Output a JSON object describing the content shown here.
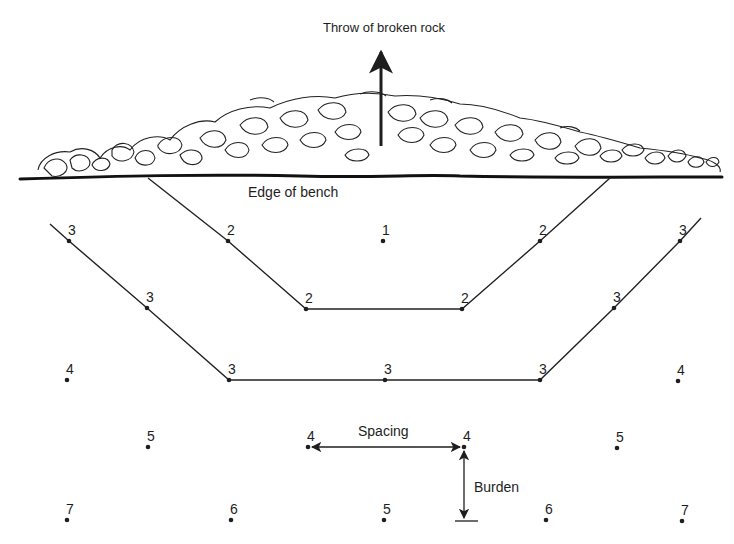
{
  "figure": {
    "title": "Throw of broken rock",
    "bench_label": "Edge of bench",
    "spacing_label": "Spacing",
    "burden_label": "Burden",
    "colors": {
      "ink": "#1e1e1e",
      "background": "#ffffff"
    }
  },
  "holes": [
    {
      "id": "r1c1",
      "delay": "3",
      "x": 69,
      "y": 241
    },
    {
      "id": "r1c2",
      "delay": "2",
      "x": 228,
      "y": 241
    },
    {
      "id": "r1c3",
      "delay": "1",
      "x": 383,
      "y": 241
    },
    {
      "id": "r1c4",
      "delay": "2",
      "x": 540,
      "y": 241
    },
    {
      "id": "r1c5",
      "delay": "3",
      "x": 680,
      "y": 241
    },
    {
      "id": "r2c1",
      "delay": "3",
      "x": 147,
      "y": 308
    },
    {
      "id": "r2c2",
      "delay": "2",
      "x": 306,
      "y": 309
    },
    {
      "id": "r2c3",
      "delay": "2",
      "x": 462,
      "y": 309
    },
    {
      "id": "r2c4",
      "delay": "3",
      "x": 614,
      "y": 308
    },
    {
      "id": "r3c1",
      "delay": "4",
      "x": 67,
      "y": 380
    },
    {
      "id": "r3c2",
      "delay": "3",
      "x": 229,
      "y": 380
    },
    {
      "id": "r3c3",
      "delay": "3",
      "x": 385,
      "y": 380
    },
    {
      "id": "r3c4",
      "delay": "3",
      "x": 540,
      "y": 380
    },
    {
      "id": "r3c5",
      "delay": "4",
      "x": 678,
      "y": 381
    },
    {
      "id": "r4c1",
      "delay": "5",
      "x": 148,
      "y": 447
    },
    {
      "id": "r4c2",
      "delay": "4",
      "x": 308,
      "y": 447
    },
    {
      "id": "r4c3",
      "delay": "4",
      "x": 464,
      "y": 447
    },
    {
      "id": "r4c4",
      "delay": "5",
      "x": 617,
      "y": 448
    },
    {
      "id": "r5c1",
      "delay": "7",
      "x": 67,
      "y": 520
    },
    {
      "id": "r5c2",
      "delay": "6",
      "x": 231,
      "y": 520
    },
    {
      "id": "r5c3",
      "delay": "5",
      "x": 384,
      "y": 520
    },
    {
      "id": "r5c4",
      "delay": "6",
      "x": 546,
      "y": 520
    },
    {
      "id": "r5c5",
      "delay": "7",
      "x": 682,
      "y": 521
    }
  ]
}
